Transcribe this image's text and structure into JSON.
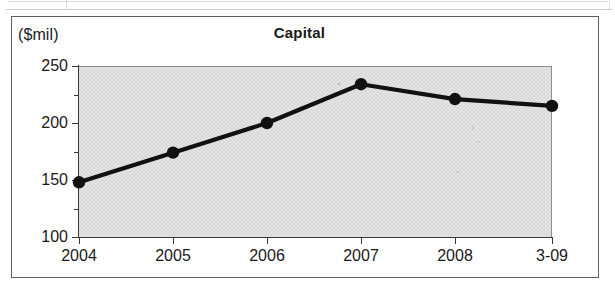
{
  "figure": {
    "unit_label": "($mil)",
    "title": "Capital"
  },
  "chart_data": {
    "type": "line",
    "title": "Capital",
    "subtitle": "",
    "xlabel": "",
    "ylabel": "($mil)",
    "unit": "$mil",
    "categories": [
      "2004",
      "2005",
      "2006",
      "2007",
      "2008",
      "3-09"
    ],
    "values": [
      148,
      174,
      200,
      234,
      221,
      215
    ],
    "series": [
      {
        "name": "Capital",
        "values": [
          148,
          174,
          200,
          234,
          221,
          215
        ]
      }
    ],
    "ylim": [
      100,
      250
    ],
    "ytick_labels": [
      "100",
      "150",
      "200",
      "250"
    ],
    "yticks": [
      100,
      150,
      200,
      250
    ],
    "yticks_minor": [
      125,
      175,
      225
    ],
    "grid": false,
    "legend": "none",
    "marker": "filled-circle",
    "line_color": "#111111",
    "marker_color": "#111111",
    "plot_background": "#e4e4e4",
    "axis_color": "#3a3a3a"
  },
  "axis": {
    "y_labels": [
      "250",
      "200",
      "150",
      "100"
    ],
    "x_labels": [
      "2004",
      "2005",
      "2006",
      "2007",
      "2008",
      "3-09"
    ]
  }
}
